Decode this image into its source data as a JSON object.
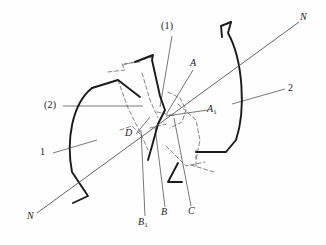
{
  "figure": {
    "type": "engineering-line-diagram",
    "background_color": "#fefefe",
    "line_color": "#1a1a1a",
    "leader_color": "#555555",
    "dashed_color": "#777777"
  },
  "labels": {
    "part_one": "1",
    "part_two": "2",
    "callout_one": "(1)",
    "callout_two": "(2)",
    "point_a": "A",
    "point_a1_base": "A",
    "point_a1_sub": "1",
    "point_b": "B",
    "point_b1_base": "B",
    "point_b1_sub": "1",
    "point_c": "C",
    "point_d": "D",
    "axis_n_top": "N",
    "axis_n_bottom": "N"
  },
  "geometry": {
    "axis_nn": {
      "name": "section-axis-N-N",
      "x1": 37,
      "y1": 213,
      "x2": 299,
      "y2": 22
    },
    "part1_arc": "M 92,88 C 72,104 66,140 72,172 L 88,196 L 73,203",
    "part1_top_edge": "M 92,88 L 118,80 L 140,97",
    "part2_arc": "M 231,22 L 228,33 C 243,60 246,110 236,140 L 226,152 L 196,152",
    "part2_top_notch": "M 231,22 L 221,26 L 222,37",
    "blade1_outline": "M 135,62 L 153,55 L 152,60 L 160,96 L 165,110 L 158,124 L 152,146 L 148,160",
    "blade2_outline": "M 178,163 L 168,182 L 182,182",
    "center_node": {
      "x": 163,
      "y": 112
    }
  },
  "leaders": [
    {
      "name": "leader-part-1",
      "x1": 53,
      "y1": 153,
      "x2": 97,
      "y2": 140
    },
    {
      "name": "leader-part-2",
      "x1": 232,
      "y1": 104,
      "x2": 285,
      "y2": 89
    },
    {
      "name": "leader-callout-2",
      "x1": 63,
      "y1": 106,
      "x2": 143,
      "y2": 106
    },
    {
      "name": "leader-callout-1",
      "x1": 172,
      "y1": 36,
      "x2": 160,
      "y2": 107
    },
    {
      "name": "leader-point-A",
      "x1": 193,
      "y1": 70,
      "x2": 167,
      "y2": 113
    },
    {
      "name": "leader-point-A1",
      "x1": 208,
      "y1": 110,
      "x2": 166,
      "y2": 116
    },
    {
      "name": "leader-point-D",
      "x1": 136,
      "y1": 134,
      "x2": 150,
      "y2": 117
    },
    {
      "name": "leader-point-B1",
      "x1": 145,
      "y1": 216,
      "x2": 141,
      "y2": 130
    },
    {
      "name": "leader-point-B",
      "x1": 165,
      "y1": 207,
      "x2": 155,
      "y2": 127
    },
    {
      "name": "leader-point-C",
      "x1": 191,
      "y1": 206,
      "x2": 174,
      "y2": 118
    }
  ],
  "dashed_paths": [
    "M 108,72 L 125,70 L 122,64 L 140,62",
    "M 123,65 L 152,57",
    "M 118,80 L 128,108 L 140,132 L 148,150",
    "M 142,73 L 150,100 L 158,118",
    "M 168,92 L 180,98 L 186,110 L 182,122 L 170,128",
    "M 178,104 L 196,120 L 200,140 L 196,160",
    "M 157,112 L 176,116",
    "M 150,128 L 166,124",
    "M 120,130 L 132,126 L 140,134",
    "M 166,146 L 186,166 L 205,162",
    "M 191,165 L 214,172",
    "M 196,166 L 196,150"
  ]
}
